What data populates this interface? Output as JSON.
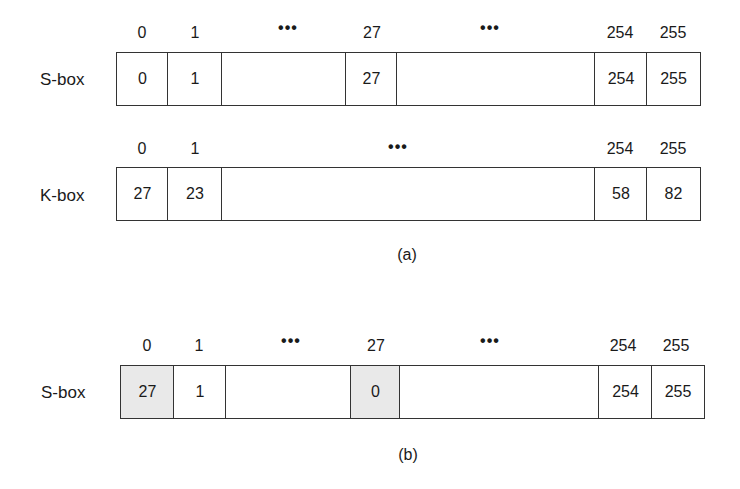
{
  "panel_a": {
    "caption": "(a)",
    "sbox": {
      "label": "S-box",
      "indices": {
        "i0": "0",
        "i1": "1",
        "dots1": "•••",
        "i27": "27",
        "dots2": "•••",
        "i254": "254",
        "i255": "255"
      },
      "cells": {
        "c0": "0",
        "c1": "1",
        "gap1": "",
        "c27": "27",
        "gap2": "",
        "c254": "254",
        "c255": "255"
      }
    },
    "kbox": {
      "label": "K-box",
      "indices": {
        "i0": "0",
        "i1": "1",
        "dots": "•••",
        "i254": "254",
        "i255": "255"
      },
      "cells": {
        "c0": "27",
        "c1": "23",
        "gap": "",
        "c254": "58",
        "c255": "82"
      }
    }
  },
  "panel_b": {
    "caption": "(b)",
    "sbox": {
      "label": "S-box",
      "indices": {
        "i0": "0",
        "i1": "1",
        "dots1": "•••",
        "i27": "27",
        "dots2": "•••",
        "i254": "254",
        "i255": "255"
      },
      "cells": {
        "c0": "27",
        "c1": "1",
        "gap1": "",
        "c27": "0",
        "gap2": "",
        "c254": "254",
        "c255": "255"
      },
      "highlighted_cells": [
        "0",
        "27"
      ],
      "highlight_color": "#e9e9e9"
    }
  }
}
